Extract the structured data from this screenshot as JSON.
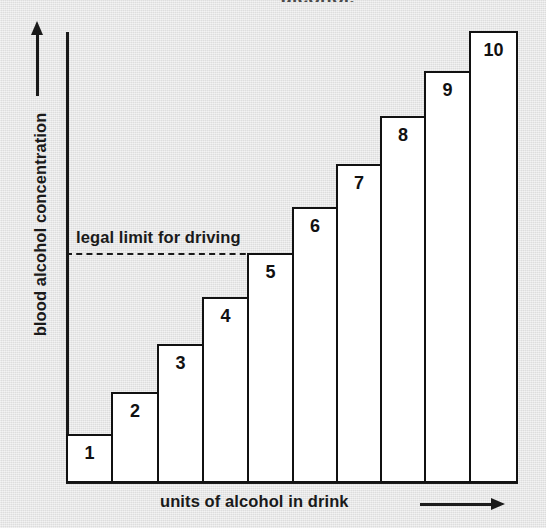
{
  "page": {
    "top_fragment_text": "alcohol.",
    "background_color": "#e4e4e4",
    "ink_color": "#111111",
    "bar_fill_color": "#ffffff"
  },
  "chart_data": {
    "type": "bar",
    "title": "",
    "subtitle": "",
    "xlabel": "units of alcohol in drink",
    "ylabel": "blood alcohol concentration",
    "categories": [
      "1",
      "2",
      "3",
      "4",
      "5",
      "6",
      "7",
      "8",
      "9",
      "10"
    ],
    "values": [
      1,
      2,
      3,
      4,
      5,
      6,
      7,
      8,
      9,
      10
    ],
    "bar_labels": [
      "1",
      "2",
      "3",
      "4",
      "5",
      "6",
      "7",
      "8",
      "9",
      "10"
    ],
    "xlim": [
      0,
      10
    ],
    "ylim": [
      0,
      10
    ],
    "grid": false,
    "legend": null,
    "axis_arrows": {
      "y": "up",
      "x": "right"
    },
    "annotations": [
      {
        "name": "legal-limit",
        "text": "legal limit for driving",
        "type": "horizontal-threshold-line",
        "style": "dashed-left-solid-right",
        "value": 5,
        "crossed_at_category": "5"
      }
    ]
  },
  "bars": [
    {
      "label": "1",
      "left_px": 66,
      "width_px": 47,
      "top_px": 434,
      "height_px": 49
    },
    {
      "label": "2",
      "left_px": 111,
      "width_px": 48,
      "top_px": 392,
      "height_px": 91
    },
    {
      "label": "3",
      "left_px": 157,
      "width_px": 47,
      "top_px": 344,
      "height_px": 139
    },
    {
      "label": "4",
      "left_px": 202,
      "width_px": 47,
      "top_px": 297,
      "height_px": 186
    },
    {
      "label": "5",
      "left_px": 247,
      "width_px": 47,
      "top_px": 253,
      "height_px": 230
    },
    {
      "label": "6",
      "left_px": 292,
      "width_px": 46,
      "top_px": 207,
      "height_px": 276
    },
    {
      "label": "7",
      "left_px": 336,
      "width_px": 46,
      "top_px": 164,
      "height_px": 319
    },
    {
      "label": "8",
      "left_px": 380,
      "width_px": 46,
      "top_px": 116,
      "height_px": 367
    },
    {
      "label": "9",
      "left_px": 424,
      "width_px": 47,
      "top_px": 71,
      "height_px": 412
    },
    {
      "label": "10",
      "left_px": 469,
      "width_px": 49,
      "top_px": 31,
      "height_px": 452
    }
  ]
}
